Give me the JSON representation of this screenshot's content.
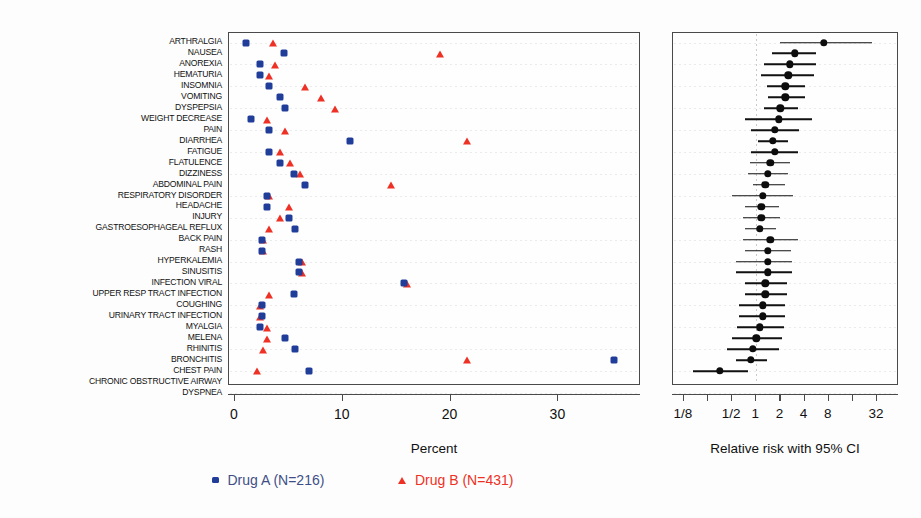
{
  "figure": {
    "left_axis_title": "Percent",
    "right_axis_title": "Relative risk with 95% CI"
  },
  "legend": {
    "items": [
      {
        "label": "Drug A (N=216)",
        "marker": "square-marker",
        "color": "#1f3d99"
      },
      {
        "label": "Drug B (N=431)",
        "marker": "triangle-marker",
        "color": "#ee3124"
      }
    ]
  },
  "chart_data": {
    "type": "scatter",
    "title": "",
    "panels": [
      {
        "name": "percent-dot-plot",
        "xlabel": "Percent",
        "xlim": [
          -0.6,
          37.8
        ],
        "xticks": [
          0,
          10,
          20,
          30
        ],
        "xtick_labels": [
          "0",
          "10",
          "20",
          "30"
        ],
        "grid": "horizontal-dotted",
        "series": [
          {
            "name": "Drug A (N=216)",
            "marker": "square",
            "color": "#1f3d99",
            "values": [
              1.0,
              4.5,
              2.3,
              2.3,
              3.2,
              4.2,
              4.6,
              1.5,
              3.2,
              10.7,
              3.2,
              4.2,
              5.5,
              6.5,
              3.0,
              3.0,
              5.0,
              5.6,
              2.5,
              2.5,
              5.9,
              5.9,
              15.7,
              5.5,
              2.5,
              2.5,
              2.3,
              4.6,
              5.6,
              35.2,
              6.9
            ]
          },
          {
            "name": "Drug B (N=431)",
            "marker": "triangle",
            "color": "#ee3124",
            "values": [
              3.5,
              19.0,
              3.7,
              3.2,
              6.5,
              8.0,
              9.3,
              3.0,
              4.6,
              21.5,
              4.2,
              5.1,
              6.0,
              14.5,
              3.2,
              5.0,
              4.2,
              3.2,
              2.6,
              2.6,
              6.2,
              6.2,
              16.0,
              3.2,
              2.3,
              2.3,
              3.0,
              3.0,
              2.6,
              21.5,
              2.0
            ]
          }
        ]
      },
      {
        "name": "relative-risk-forest-plot",
        "xlabel": "Relative risk with 95% CI",
        "scale": "log2",
        "xlim": [
          0.105,
          42.0
        ],
        "xticks": [
          0.125,
          0.25,
          0.5,
          1,
          2,
          4,
          8,
          16,
          32
        ],
        "xtick_labels": [
          "1/8",
          "",
          "1/2",
          "1",
          "2",
          "4",
          "8",
          "",
          "32"
        ],
        "reference_line": 1,
        "grid": "horizontal-dotted",
        "estimates": [
          7.0,
          3.0,
          2.6,
          2.5,
          2.3,
          2.3,
          2.0,
          1.9,
          1.7,
          1.6,
          1.7,
          1.5,
          1.4,
          1.3,
          1.2,
          1.15,
          1.15,
          1.1,
          1.5,
          1.4,
          1.4,
          1.4,
          1.3,
          1.3,
          1.2,
          1.2,
          1.1,
          1.0,
          0.9,
          0.85,
          0.35
        ],
        "ci_low": [
          2.0,
          1.55,
          1.25,
          1.15,
          1.35,
          1.4,
          1.25,
          0.72,
          0.85,
          1.05,
          0.85,
          0.84,
          0.78,
          0.9,
          0.5,
          0.72,
          0.68,
          0.72,
          0.68,
          0.72,
          0.55,
          0.55,
          0.72,
          0.72,
          0.6,
          0.6,
          0.58,
          0.5,
          0.43,
          0.55,
          0.16
        ],
        "ci_high": [
          28.0,
          5.6,
          5.6,
          5.3,
          4.1,
          4.1,
          3.3,
          5.0,
          3.4,
          2.5,
          3.3,
          2.6,
          2.5,
          2.3,
          2.9,
          1.9,
          1.95,
          1.75,
          3.3,
          2.7,
          2.8,
          2.8,
          2.4,
          2.4,
          2.3,
          2.3,
          2.2,
          2.1,
          1.9,
          1.35,
          0.78
        ]
      }
    ],
    "categories": [
      "ARTHRALGIA",
      "NAUSEA",
      "ANOREXIA",
      "HEMATURIA",
      "INSOMNIA",
      "VOMITING",
      "DYSPEPSIA",
      "WEIGHT DECREASE",
      "PAIN",
      "DIARRHEA",
      "FATIGUE",
      "FLATULENCE",
      "DIZZINESS",
      "ABDOMINAL PAIN",
      "RESPIRATORY DISORDER",
      "HEADACHE",
      "INJURY",
      "GASTROESOPHAGEAL REFLUX",
      "BACK PAIN",
      "RASH",
      "HYPERKALEMIA",
      "SINUSITIS",
      "INFECTION VIRAL",
      "UPPER RESP TRACT INFECTION",
      "COUGHING",
      "URINARY TRACT INFECTION",
      "MYALGIA",
      "MELENA",
      "RHINITIS",
      "BRONCHITIS",
      "CHEST PAIN",
      "CHRONIC OBSTRUCTIVE AIRWAY",
      "DYSPNEA"
    ]
  }
}
